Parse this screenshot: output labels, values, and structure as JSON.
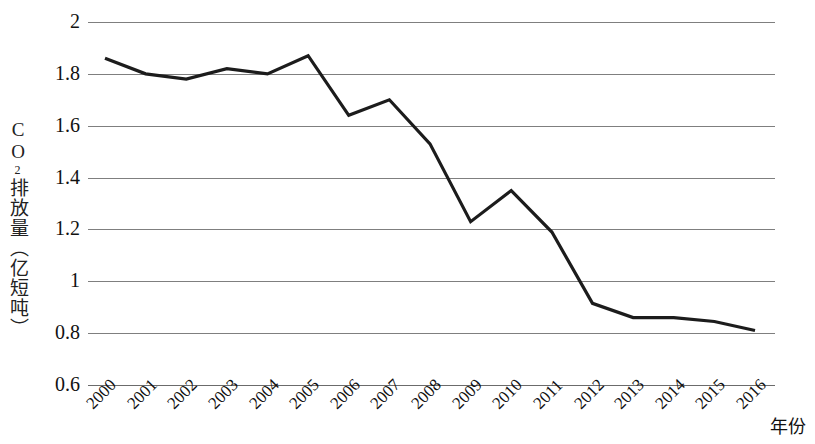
{
  "chart_data": {
    "type": "line",
    "title": "",
    "xlabel": "年份",
    "ylabel": "CO₂排放量（亿短吨）",
    "ylabel_parts": {
      "prefix": "CO",
      "sub": "2",
      "suffix": "排放量（亿短吨）"
    },
    "categories": [
      "2000",
      "2001",
      "2002",
      "2003",
      "2004",
      "2005",
      "2006",
      "2007",
      "2008",
      "2009",
      "2010",
      "2011",
      "2012",
      "2013",
      "2014",
      "2015",
      "2016"
    ],
    "x": [
      2000,
      2001,
      2002,
      2003,
      2004,
      2005,
      2006,
      2007,
      2008,
      2009,
      2010,
      2011,
      2012,
      2013,
      2014,
      2015,
      2016
    ],
    "values": [
      1.86,
      1.8,
      1.78,
      1.82,
      1.8,
      1.87,
      1.64,
      1.7,
      1.53,
      1.23,
      1.35,
      1.19,
      0.915,
      0.86,
      0.86,
      0.845,
      0.81
    ],
    "series": [
      {
        "name": "CO₂排放量",
        "values": [
          1.86,
          1.8,
          1.78,
          1.82,
          1.8,
          1.87,
          1.64,
          1.7,
          1.53,
          1.23,
          1.35,
          1.19,
          0.915,
          0.86,
          0.86,
          0.845,
          0.81
        ]
      }
    ],
    "ylim": [
      0.6,
      2.0
    ],
    "yticks": [
      2,
      1.8,
      1.6,
      1.4,
      1.2,
      1,
      0.8,
      0.6
    ],
    "ytick_labels": [
      "2",
      "1.8",
      "1.6",
      "1.4",
      "1.2",
      "1",
      "0.8",
      "0.6"
    ],
    "grid": true,
    "grid_axis": "y",
    "legend": false,
    "legend_position": "none",
    "line_color": "#1c1c1c",
    "grid_color": "#7f7f7f",
    "line_width": 3.2
  }
}
